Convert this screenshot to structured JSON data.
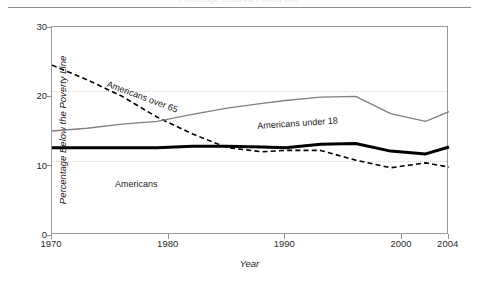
{
  "caption": {
    "text": "Percentage Below the Poverty Line"
  },
  "chart_data": {
    "type": "line",
    "title": "",
    "xlabel": "Year",
    "ylabel": "Percentage Below the Poverty Line",
    "xlim": [
      1970,
      2004
    ],
    "ylim": [
      0,
      30
    ],
    "yticks": [
      "0",
      "10",
      "20",
      "30"
    ],
    "ytick_values": [
      0,
      10,
      20,
      30
    ],
    "xticks": [
      "1970",
      "1980",
      "1990",
      "2000",
      "2004"
    ],
    "xtick_values": [
      1970,
      1980,
      1990,
      2000,
      2004
    ],
    "grid": "horizontal dotted at 10 and 20",
    "legend": "inline labels on curves",
    "x": [
      1970,
      1973,
      1976,
      1979,
      1982,
      1985,
      1988,
      1990,
      1993,
      1996,
      1999,
      2002,
      2004
    ],
    "series": [
      {
        "name": "Americans over 65",
        "label": "Americans over 65",
        "style": "dashed",
        "color": "#000000",
        "width": 1.6,
        "values": [
          24.5,
          22.4,
          20.0,
          17.0,
          14.6,
          12.6,
          12.0,
          12.2,
          12.2,
          10.8,
          9.7,
          10.4,
          9.8
        ]
      },
      {
        "name": "Americans under 18",
        "label": "Americans under 18",
        "style": "solid",
        "color": "#808080",
        "width": 1.3,
        "values": [
          15.0,
          15.4,
          16.0,
          16.4,
          17.4,
          18.3,
          19.0,
          19.4,
          19.9,
          20.0,
          17.5,
          16.4,
          17.8
        ]
      },
      {
        "name": "Americans",
        "label": "Americans",
        "style": "solid-thick",
        "color": "#000000",
        "width": 3.0,
        "values": [
          12.6,
          12.6,
          12.6,
          12.6,
          12.8,
          12.8,
          12.7,
          12.6,
          13.1,
          13.2,
          12.1,
          11.7,
          12.7
        ]
      }
    ]
  },
  "colors": {
    "frame": "#9a9a9a",
    "grid": "#d9d3c8",
    "under18": "#808080",
    "over65": "#000000",
    "all": "#000000",
    "background": "#ffffff"
  }
}
